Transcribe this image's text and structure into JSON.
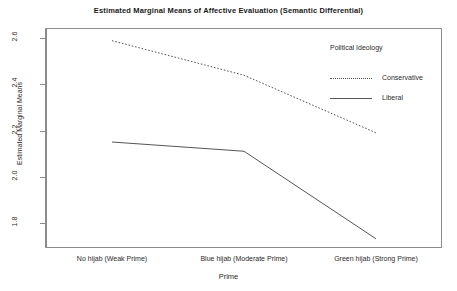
{
  "chart_data": {
    "type": "line",
    "title": "Estimated Marginal Means of Affective Evaluation (Semantic Differential)",
    "xlabel": "Prime",
    "ylabel": "Estimated Marginal Means",
    "categories": [
      "No hijab (Weak Prime)",
      "Blue hijab (Moderate Prime)",
      "Green hijab (Strong Prime)"
    ],
    "series": [
      {
        "name": "Conservative",
        "values": [
          2.59,
          2.44,
          2.19
        ],
        "linestyle": "dotted"
      },
      {
        "name": "Liberal",
        "values": [
          2.15,
          2.11,
          1.73
        ],
        "linestyle": "solid"
      }
    ],
    "yticks": [
      "2.6",
      "2.4",
      "2.2",
      "2.0",
      "1.8"
    ],
    "ytick_values": [
      2.6,
      2.4,
      2.2,
      2.0,
      1.8
    ],
    "ylim": [
      1.69,
      2.645
    ],
    "grid": false,
    "legend": {
      "title": "Political Ideology",
      "position": "top-right-inside",
      "entries": [
        "Conservative",
        "Liberal"
      ]
    },
    "colors": {
      "line": "#555555",
      "frame": "#8c8c8c",
      "text": "#2b2b2b",
      "background": "#ffffff"
    }
  }
}
